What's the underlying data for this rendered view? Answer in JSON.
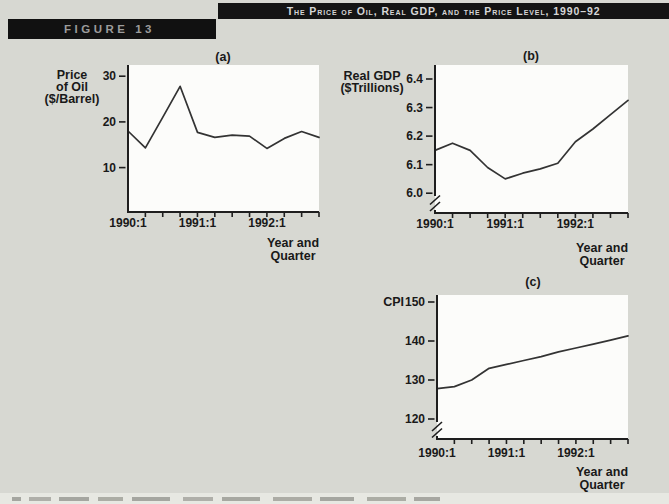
{
  "page": {
    "title_bar": "The Price of Oil, Real GDP, and the Price Level, 1990–92",
    "figure_label": "FIGURE 13"
  },
  "colors": {
    "background": "#d7d8d2",
    "panel_black": "#141414",
    "title_text": "#d6d6d6",
    "figure_label_text": "#9c9c9c",
    "plot_background": "#fcfcfa",
    "axis": "#1e1e1e",
    "line": "#333333",
    "text": "#191919"
  },
  "chart_data": [
    {
      "id": "a",
      "type": "line",
      "panel_label": "(a)",
      "ylabel_lines": [
        "Price",
        "of Oil",
        "($/Barrel)"
      ],
      "x": [
        "1990:1",
        "1990:2",
        "1990:3",
        "1990:4",
        "1991:1",
        "1991:2",
        "1991:3",
        "1991:4",
        "1992:1",
        "1992:2",
        "1992:3",
        "1992:4"
      ],
      "values": [
        18,
        14.3,
        21,
        27.8,
        17.7,
        16.6,
        17.1,
        16.9,
        14.2,
        16.4,
        17.9,
        16.6
      ],
      "ytick_values": [
        10,
        20,
        30
      ],
      "ytick_labels": [
        "10",
        "20",
        "30"
      ],
      "ylim": [
        0,
        32.5
      ],
      "xtick_labels": [
        "1990:1",
        "1991:1",
        "1992:1"
      ],
      "xtick_positions": [
        0,
        4,
        8
      ],
      "xlabel_lines": [
        "Year and",
        "Quarter"
      ],
      "axis_break": false,
      "grid": false
    },
    {
      "id": "b",
      "type": "line",
      "panel_label": "(b)",
      "ylabel_lines": [
        "Real GDP",
        "($Trillions)"
      ],
      "x": [
        "1990:1",
        "1990:2",
        "1990:3",
        "1990:4",
        "1991:1",
        "1991:2",
        "1991:3",
        "1991:4",
        "1992:1",
        "1992:2",
        "1992:3",
        "1992:4"
      ],
      "values": [
        6.15,
        6.175,
        6.15,
        6.09,
        6.05,
        6.07,
        6.085,
        6.105,
        6.18,
        6.225,
        6.275,
        6.325
      ],
      "ytick_values": [
        6.0,
        6.1,
        6.2,
        6.3,
        6.4
      ],
      "ytick_labels": [
        "6.0",
        "6.1",
        "6.2",
        "6.3",
        "6.4"
      ],
      "ylim": [
        5.95,
        6.45
      ],
      "xtick_labels": [
        "1990:1",
        "1991:1",
        "1992:1"
      ],
      "xtick_positions": [
        0,
        4,
        8
      ],
      "xlabel_lines": [
        "Year and",
        "Quarter"
      ],
      "axis_break": true,
      "grid": false
    },
    {
      "id": "c",
      "type": "line",
      "panel_label": "(c)",
      "ylabel_lines": [
        "CPI"
      ],
      "x": [
        "1990:1",
        "1990:2",
        "1990:3",
        "1990:4",
        "1991:1",
        "1991:2",
        "1991:3",
        "1991:4",
        "1992:1",
        "1992:2",
        "1992:3",
        "1992:4"
      ],
      "values": [
        127.8,
        128.3,
        130,
        133,
        134,
        135,
        136,
        137.2,
        138.2,
        139.2,
        140.2,
        141.3
      ],
      "ytick_values": [
        120,
        130,
        140,
        150
      ],
      "ytick_labels": [
        "120",
        "130",
        "140",
        "150"
      ],
      "ylim": [
        116,
        152
      ],
      "xtick_labels": [
        "1990:1",
        "1991:1",
        "1992:1"
      ],
      "xtick_positions": [
        0,
        4,
        8
      ],
      "xlabel_lines": [
        "Year and",
        "Quarter"
      ],
      "axis_break": true,
      "grid": false
    }
  ]
}
